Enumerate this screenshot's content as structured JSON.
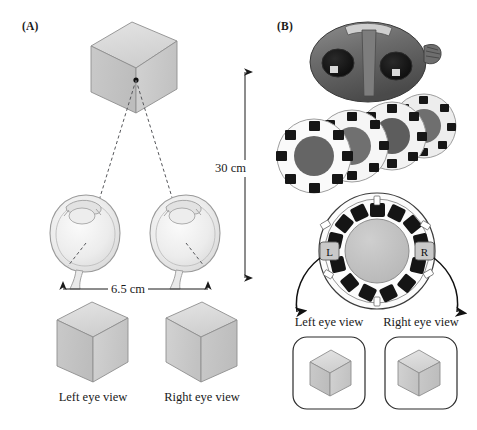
{
  "figure": {
    "panels": [
      {
        "id": "A",
        "label": "(A)"
      },
      {
        "id": "B",
        "label": "(B)"
      }
    ]
  },
  "panel_a": {
    "label": "(A)",
    "stimulus": {
      "name": "cube",
      "fixation_point_label": ""
    },
    "dimensions": {
      "viewing_distance": "30 cm",
      "interocular_distance": "6.5 cm"
    },
    "eyes": [
      {
        "side": "left",
        "name": "left-eye"
      },
      {
        "side": "right",
        "name": "right-eye"
      }
    ],
    "views": [
      {
        "label": "Left eye view"
      },
      {
        "label": "Right eye view"
      }
    ]
  },
  "panel_b": {
    "label": "(B)",
    "photo": {
      "subject": "view-master stereoscope with reels",
      "reel_count": 4
    },
    "reel": {
      "frames_total": 14,
      "left_frame_label": "L",
      "right_frame_label": "R"
    },
    "views": [
      {
        "label": "Left eye view"
      },
      {
        "label": "Right eye view"
      }
    ]
  },
  "colors": {
    "cube_top": "#d9d9d9",
    "cube_left": "#c4c4c4",
    "cube_right": "#cdcdcd",
    "cube_outline": "#8a8a8a",
    "eye_fill": "#e8e8e8",
    "eye_outline": "#9a9a9a",
    "reel_body": "#fbfbfb",
    "reel_hub": "#c0c0c0",
    "reel_frame": "#151515",
    "badge_fill": "#c9c9c9",
    "line": "#1a1a1a",
    "text": "#1a1a1a"
  }
}
